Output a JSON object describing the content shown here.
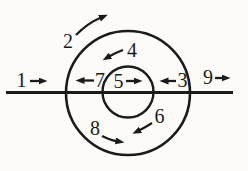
{
  "figure": {
    "background_color": "#fcfbf8",
    "ink_color": "#1b1b1b",
    "arrows": [
      {
        "label": "1",
        "location": "outside left, on horizontal line",
        "direction": "right"
      },
      {
        "label": "2",
        "location": "upper left, outside outer circle",
        "direction": "up-right"
      },
      {
        "label": "3",
        "location": "inside outer circle right, on line",
        "direction": "left"
      },
      {
        "label": "4",
        "location": "above inner circle",
        "direction": "down-left"
      },
      {
        "label": "5",
        "location": "inside inner circle, on line",
        "direction": "right"
      },
      {
        "label": "6",
        "location": "below inner circle",
        "direction": "down-left"
      },
      {
        "label": "7",
        "location": "inside outer circle left, on line",
        "direction": "left"
      },
      {
        "label": "8",
        "location": "lower left, inside outer circle",
        "direction": "down-right"
      },
      {
        "label": "9",
        "location": "outside right, on line",
        "direction": "right"
      }
    ]
  }
}
